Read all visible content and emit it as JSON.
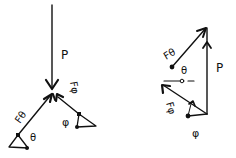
{
  "diagram": {
    "colors": {
      "ink": "#111111",
      "background": "#ffffff"
    },
    "left_panel": {
      "title": "free-body-diagram",
      "labels": {
        "P": "P",
        "F_theta": "Fθ",
        "theta": "θ",
        "F_phi": "Fφ",
        "phi": "φ"
      }
    },
    "right_panel": {
      "title": "force-triangle",
      "labels": {
        "P": "P",
        "F_theta": "Fθ",
        "theta": "θ",
        "F_phi": "Fφ",
        "phi": "φ"
      }
    }
  }
}
